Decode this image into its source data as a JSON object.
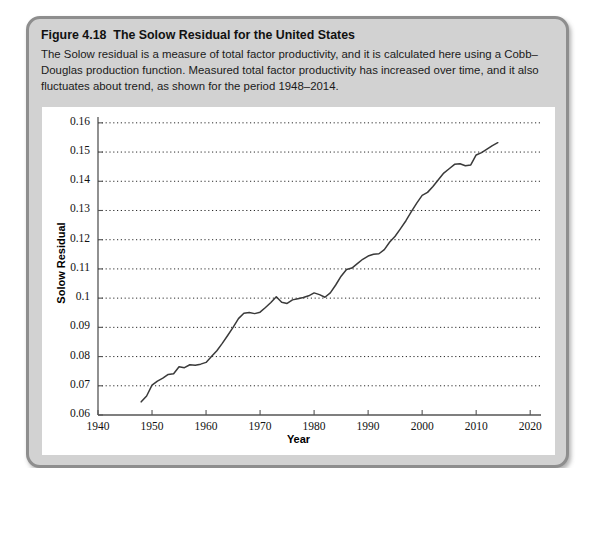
{
  "figure": {
    "number": "Figure 4.18",
    "title": "The Solow Residual for the United States",
    "description": "The Solow residual is a measure of total factor productivity, and it is calculated here using a Cobb–Douglas production function. Measured total factor productivity has increased over time, and it also fluctuates about trend, as shown for the period 1948–2014."
  },
  "chart_data": {
    "type": "line",
    "title": "The Solow Residual for the United States",
    "xlabel": "Year",
    "ylabel": "Solow Residual",
    "xlim": [
      1940,
      2022
    ],
    "ylim": [
      0.06,
      0.162
    ],
    "xticks": [
      1940,
      1950,
      1960,
      1970,
      1980,
      1990,
      2000,
      2010,
      2020
    ],
    "yticks": [
      0.06,
      0.07,
      0.08,
      0.09,
      0.1,
      0.11,
      0.12,
      0.13,
      0.14,
      0.15,
      0.16
    ],
    "ytick_labels": [
      "0.06",
      "0.07",
      "0.08",
      "0.09",
      "0.1",
      "0.11",
      "0.12",
      "0.13",
      "0.14",
      "0.15",
      "0.16"
    ],
    "xtick_labels": [
      "1940",
      "1950",
      "1960",
      "1970",
      "1980",
      "1990",
      "2000",
      "2010",
      "2020"
    ],
    "grid": "horizontal-dotted",
    "legend": null,
    "line_color": "#3a3a3a",
    "series": [
      {
        "name": "Solow Residual",
        "x": [
          1948,
          1949,
          1950,
          1951,
          1952,
          1953,
          1954,
          1955,
          1956,
          1957,
          1958,
          1959,
          1960,
          1961,
          1962,
          1963,
          1964,
          1965,
          1966,
          1967,
          1968,
          1969,
          1970,
          1971,
          1972,
          1973,
          1974,
          1975,
          1976,
          1977,
          1978,
          1979,
          1980,
          1981,
          1982,
          1983,
          1984,
          1985,
          1986,
          1987,
          1988,
          1989,
          1990,
          1991,
          1992,
          1993,
          1994,
          1995,
          1996,
          1997,
          1998,
          1999,
          2000,
          2001,
          2002,
          2003,
          2004,
          2005,
          2006,
          2007,
          2008,
          2009,
          2010,
          2011,
          2012,
          2013,
          2014
        ],
        "values": [
          0.0645,
          0.0665,
          0.0702,
          0.0716,
          0.0726,
          0.0739,
          0.0741,
          0.0765,
          0.0762,
          0.0772,
          0.077,
          0.0774,
          0.078,
          0.08,
          0.082,
          0.0845,
          0.0872,
          0.09,
          0.093,
          0.0948,
          0.0951,
          0.0947,
          0.0952,
          0.0968,
          0.0985,
          0.1005,
          0.0986,
          0.0982,
          0.0994,
          0.0998,
          0.1002,
          0.1008,
          0.1018,
          0.1012,
          0.1003,
          0.1018,
          0.1045,
          0.1075,
          0.1098,
          0.1103,
          0.1118,
          0.1133,
          0.1144,
          0.115,
          0.1152,
          0.1166,
          0.1192,
          0.1212,
          0.1238,
          0.1265,
          0.1296,
          0.1325,
          0.1352,
          0.1362,
          0.1382,
          0.1405,
          0.1428,
          0.1443,
          0.1458,
          0.146,
          0.1453,
          0.1456,
          0.149,
          0.1498,
          0.151,
          0.1522,
          0.1532
        ]
      }
    ]
  }
}
